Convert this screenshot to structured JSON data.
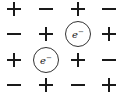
{
  "diagram": {
    "title": "",
    "grid": {
      "rows": 4,
      "cols": 4,
      "col_x": [
        14,
        46,
        78,
        109
      ],
      "row_y": [
        9,
        34,
        60,
        85
      ],
      "cells": [
        [
          "+",
          "-",
          "+",
          "-"
        ],
        [
          "-",
          "+",
          "e",
          "+"
        ],
        [
          "+",
          "e",
          "+",
          "-"
        ],
        [
          "-",
          "+",
          "-",
          "+"
        ]
      ]
    },
    "electron_label": "e",
    "electron_charge": "−",
    "symbol_color": "#1a1a1a",
    "circle_color": "#333333"
  }
}
